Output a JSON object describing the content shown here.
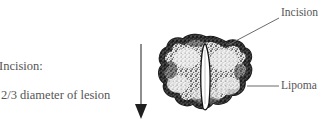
{
  "figure": {
    "background_color": "#ffffff",
    "width": 327,
    "height": 134
  },
  "annotations": {
    "incision_instruction_title": "Incision:",
    "incision_instruction_detail": "2/3 diameter of lesion"
  },
  "labels": {
    "incision": "Incision",
    "lipoma": "Lipoma"
  },
  "colors": {
    "ink": "#555555",
    "line": "#6b6b6b",
    "mass_dark": "#2b2b2b",
    "mass_mid": "#5c5c5c",
    "mass_light": "#d8d8d8",
    "incision_fill": "#ffffff",
    "background": "#ffffff"
  },
  "icons": {
    "down_arrow": "down-arrow-icon",
    "lipoma_mass": "lipoma-mass-icon",
    "incision_slit": "incision-slit-icon"
  }
}
